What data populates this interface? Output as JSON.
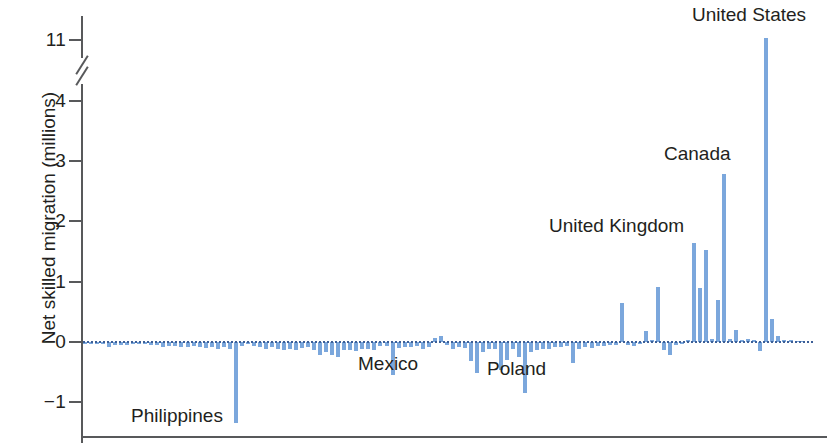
{
  "chart_data": {
    "type": "bar",
    "title": "",
    "subtitle": "",
    "xlabel": "",
    "ylabel": "Net skilled migration (millions)",
    "grid": false,
    "legend": null,
    "axis_break": {
      "between": [
        4,
        11
      ],
      "style": "double-slash"
    },
    "yticks": [
      11,
      4,
      3,
      2,
      1,
      0,
      -1
    ],
    "ytick_labels": [
      "11",
      "4",
      "3",
      "2",
      "1",
      "0",
      "−1"
    ],
    "ylim": [
      -1.6,
      11.6
    ],
    "bar_color": "#7ba7dc",
    "zero_line_color": "#3c5f97",
    "axis_color": "#58595b",
    "annotations": [
      {
        "label": "Philippines",
        "value": -1.35,
        "bar_index": 25
      },
      {
        "label": "Mexico",
        "value": -0.55,
        "bar_index": 51
      },
      {
        "label": "Poland",
        "value": -0.85,
        "bar_index": 73
      },
      {
        "label": "United Kingdom",
        "value": 1.65,
        "bar_index": 95
      },
      {
        "label": "Canada",
        "value": 2.78,
        "bar_index": 102
      },
      {
        "label": "United States",
        "value": 11.2,
        "bar_index": 113
      }
    ],
    "categories": [
      "c1",
      "c2",
      "c3",
      "c4",
      "c5",
      "c6",
      "c7",
      "c8",
      "c9",
      "c10",
      "c11",
      "c12",
      "c13",
      "c14",
      "c15",
      "c16",
      "c17",
      "c18",
      "c19",
      "c20",
      "c21",
      "c22",
      "c23",
      "c24",
      "c25",
      "Philippines",
      "c27",
      "c28",
      "c29",
      "c30",
      "c31",
      "c32",
      "c33",
      "c34",
      "c35",
      "c36",
      "c37",
      "c38",
      "c39",
      "c40",
      "c41",
      "c42",
      "c43",
      "c44",
      "c45",
      "c46",
      "c47",
      "c48",
      "c49",
      "c50",
      "c51",
      "Mexico",
      "c53",
      "c54",
      "c55",
      "c56",
      "c57",
      "c58",
      "c59",
      "c60",
      "c61",
      "c62",
      "c63",
      "c64",
      "c65",
      "c66",
      "c67",
      "c68",
      "c69",
      "c70",
      "c71",
      "c72",
      "c73",
      "Poland",
      "c75",
      "c76",
      "c77",
      "c78",
      "c79",
      "c80",
      "c81",
      "c82",
      "c83",
      "c84",
      "c85",
      "c86",
      "c87",
      "c88",
      "c89",
      "c90",
      "c91",
      "c92",
      "c93",
      "c94",
      "c95",
      "United Kingdom",
      "c97",
      "c98",
      "c99",
      "c100",
      "c101",
      "c102",
      "Canada",
      "c104",
      "c105",
      "c106",
      "c107",
      "c108",
      "c109",
      "c110",
      "c111",
      "c112",
      "c113",
      "United States",
      "c115",
      "c116",
      "c117",
      "c118",
      "c119",
      "c120"
    ],
    "values": [
      -0.02,
      -0.02,
      -0.02,
      -0.04,
      -0.08,
      -0.05,
      -0.05,
      -0.05,
      -0.03,
      -0.02,
      -0.02,
      -0.05,
      -0.05,
      -0.08,
      -0.07,
      -0.06,
      -0.08,
      -0.09,
      -0.07,
      -0.08,
      -0.1,
      -0.09,
      -0.11,
      -0.09,
      -0.12,
      -1.35,
      -0.06,
      -0.04,
      -0.07,
      -0.09,
      -0.11,
      -0.09,
      -0.12,
      -0.14,
      -0.11,
      -0.13,
      -0.1,
      -0.09,
      -0.14,
      -0.22,
      -0.17,
      -0.22,
      -0.25,
      -0.14,
      -0.13,
      -0.15,
      -0.11,
      -0.12,
      -0.13,
      -0.06,
      -0.06,
      -0.55,
      -0.1,
      -0.09,
      -0.08,
      -0.07,
      -0.12,
      -0.08,
      0.06,
      0.1,
      -0.05,
      -0.11,
      -0.09,
      -0.1,
      -0.31,
      -0.52,
      -0.16,
      -0.11,
      -0.12,
      -0.46,
      -0.3,
      -0.12,
      -0.25,
      -0.85,
      -0.17,
      -0.14,
      -0.12,
      -0.11,
      -0.09,
      -0.08,
      -0.06,
      -0.34,
      -0.12,
      -0.09,
      -0.1,
      -0.07,
      -0.06,
      -0.05,
      -0.05,
      0.65,
      -0.05,
      -0.06,
      -0.03,
      0.18,
      0.03,
      0.91,
      -0.13,
      -0.21,
      -0.05,
      -0.04,
      0.04,
      1.65,
      0.9,
      1.53,
      0.05,
      0.7,
      2.78,
      0.05,
      0.2,
      0.04,
      0.05,
      0.03,
      -0.15,
      11.2,
      0.38,
      0.1,
      0.04,
      0.03,
      0.02,
      0.02
    ]
  }
}
